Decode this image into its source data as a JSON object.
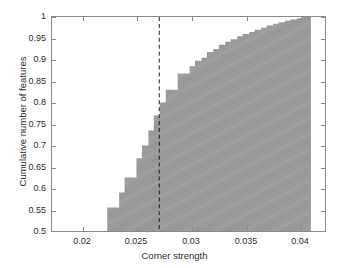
{
  "chart_data": {
    "type": "area",
    "title": "",
    "subtitle": "",
    "xlabel": "Corner strength",
    "ylabel": "Cumulative number of features",
    "xlim": [
      0.0177,
      0.0429
    ],
    "ylim": [
      0.5,
      1.0
    ],
    "grid": false,
    "legend": null,
    "style": "filled step / staircase cumulative distribution, gray fill, no edge line",
    "fill_color": "#999999",
    "axis_color": "#8a8a8a",
    "text_color": "#2b2b2b",
    "background_color": "#ffffff",
    "xticks": [
      0.02,
      0.025,
      0.03,
      0.035,
      0.04
    ],
    "xtick_labels": [
      "0.02",
      "0.025",
      "0.03",
      "0.035",
      "0.04"
    ],
    "yticks": [
      0.5,
      0.55,
      0.6,
      0.65,
      0.7,
      0.75,
      0.8,
      0.85,
      0.9,
      0.95,
      1
    ],
    "ytick_labels": [
      "0.5",
      "0.55",
      "0.6",
      "0.65",
      "0.7",
      "0.75",
      "0.8",
      "0.85",
      "0.9",
      "0.95",
      "1"
    ],
    "x": [
      0.0222,
      0.0228,
      0.0233,
      0.0239,
      0.0244,
      0.0249,
      0.0255,
      0.026,
      0.0266,
      0.0271,
      0.02765,
      0.0282,
      0.0287,
      0.0293,
      0.0298,
      0.0304,
      0.0309,
      0.0315,
      0.032,
      0.0326,
      0.0331,
      0.0337,
      0.0342,
      0.0348,
      0.0353,
      0.0359,
      0.0364,
      0.037,
      0.0375,
      0.0381,
      0.0386,
      0.0392,
      0.0397,
      0.0403,
      0.0408,
      0.0416
    ],
    "y": [
      0.5,
      0.555,
      0.555,
      0.59,
      0.625,
      0.625,
      0.67,
      0.7,
      0.735,
      0.77,
      0.8,
      0.83,
      0.83,
      0.868,
      0.868,
      0.885,
      0.898,
      0.905,
      0.918,
      0.925,
      0.935,
      0.942,
      0.948,
      0.955,
      0.96,
      0.965,
      0.97,
      0.975,
      0.98,
      0.984,
      0.988,
      0.991,
      0.994,
      0.997,
      1.0,
      1.0
    ],
    "annotations": [
      {
        "name": "threshold-line",
        "type": "vertical-dashed-line",
        "x": 0.0276,
        "label": "",
        "color": "#1a1a1a",
        "dash": "4 3"
      }
    ],
    "data_extent": {
      "x_start": 0.0222,
      "x_end": 0.0416,
      "y_start": 0.5,
      "y_end": 1.0
    }
  }
}
